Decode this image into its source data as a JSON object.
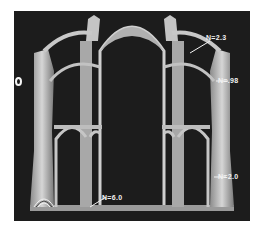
{
  "figure": {
    "point_marker": "O",
    "annotations": [
      {
        "id": "upper-flying-buttress",
        "text": "N=2.3"
      },
      {
        "id": "lower-flying-buttress",
        "text": "N=.98"
      },
      {
        "id": "buttress-pier",
        "text": "N=2.0"
      },
      {
        "id": "interior-pier-base",
        "text": "N=6.0"
      }
    ],
    "colors": {
      "background": "#1c1c1c",
      "model": "#bdbdbd",
      "label": "#f2f2f2",
      "page": "#ffffff"
    }
  }
}
